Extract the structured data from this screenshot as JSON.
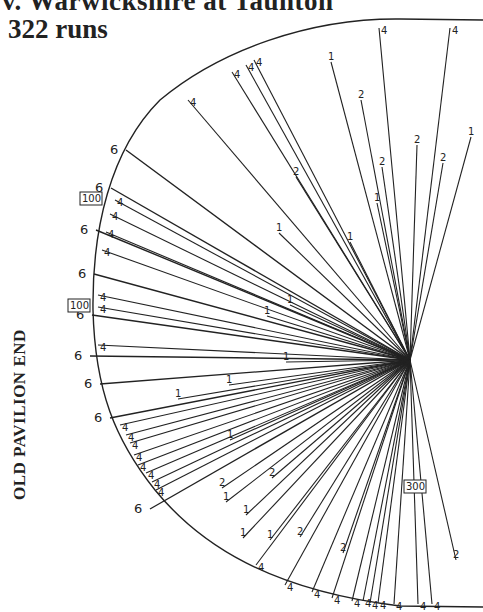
{
  "header": {
    "title_line1": "v. Warwickshire at Taunton",
    "title_line2": "322 runs"
  },
  "side_label": "OLD PAVILION END",
  "diagram": {
    "type": "cricket-wagon-wheel",
    "origin": [
      410,
      360
    ],
    "boundary_label": "4",
    "six_label": "6",
    "milestones": [
      {
        "label": "100",
        "x": 94,
        "y": 200
      },
      {
        "label": "100",
        "x": 82,
        "y": 307
      },
      {
        "label": "300",
        "x": 418,
        "y": 488
      }
    ],
    "sixes": [
      [
        112,
        148
      ],
      [
        97,
        186
      ],
      [
        82,
        228
      ],
      [
        80,
        272
      ],
      [
        78,
        313
      ],
      [
        76,
        354
      ],
      [
        86,
        382
      ],
      [
        96,
        416
      ],
      [
        136,
        507
      ]
    ],
    "fours": [
      [
        232,
        72
      ],
      [
        246,
        65
      ],
      [
        254,
        60
      ],
      [
        188,
        100
      ],
      [
        379,
        28
      ],
      [
        450,
        28
      ],
      [
        115,
        200
      ],
      [
        110,
        214
      ],
      [
        106,
        232
      ],
      [
        102,
        250
      ],
      [
        98,
        295
      ],
      [
        98,
        307
      ],
      [
        98,
        345
      ],
      [
        120,
        425
      ],
      [
        126,
        435
      ],
      [
        130,
        443
      ],
      [
        134,
        455
      ],
      [
        138,
        465
      ],
      [
        146,
        473
      ],
      [
        152,
        482
      ],
      [
        156,
        490
      ],
      [
        256,
        565
      ],
      [
        285,
        585
      ],
      [
        312,
        592
      ],
      [
        332,
        598
      ],
      [
        352,
        601
      ],
      [
        363,
        601
      ],
      [
        370,
        603
      ],
      [
        378,
        603
      ],
      [
        394,
        604
      ],
      [
        418,
        604
      ],
      [
        432,
        604
      ]
    ],
    "ones_twos": [
      {
        "label": "1",
        "x": 331,
        "y": 62
      },
      {
        "label": "2",
        "x": 361,
        "y": 100
      },
      {
        "label": "2",
        "x": 296,
        "y": 177
      },
      {
        "label": "2",
        "x": 417,
        "y": 145
      },
      {
        "label": "2",
        "x": 382,
        "y": 167
      },
      {
        "label": "2",
        "x": 443,
        "y": 163
      },
      {
        "label": "1",
        "x": 471,
        "y": 137
      },
      {
        "label": "1",
        "x": 377,
        "y": 203
      },
      {
        "label": "1",
        "x": 350,
        "y": 242
      },
      {
        "label": "1",
        "x": 279,
        "y": 233
      },
      {
        "label": "1",
        "x": 290,
        "y": 305
      },
      {
        "label": "1",
        "x": 267,
        "y": 316
      },
      {
        "label": "1",
        "x": 286,
        "y": 362
      },
      {
        "label": "1",
        "x": 229,
        "y": 385
      },
      {
        "label": "1",
        "x": 178,
        "y": 399
      },
      {
        "label": "1",
        "x": 230,
        "y": 440
      },
      {
        "label": "2",
        "x": 222,
        "y": 488
      },
      {
        "label": "2",
        "x": 272,
        "y": 478
      },
      {
        "label": "1",
        "x": 226,
        "y": 502
      },
      {
        "label": "1",
        "x": 246,
        "y": 515
      },
      {
        "label": "2",
        "x": 300,
        "y": 537
      },
      {
        "label": "2",
        "x": 343,
        "y": 553
      },
      {
        "label": "2",
        "x": 456,
        "y": 560
      },
      {
        "label": "1",
        "x": 270,
        "y": 540
      },
      {
        "label": "1",
        "x": 243,
        "y": 538
      }
    ]
  }
}
